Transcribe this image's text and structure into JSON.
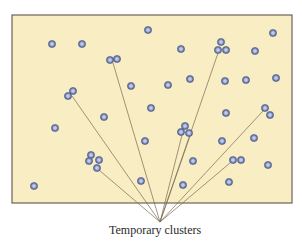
{
  "diagram": {
    "type": "particle-field",
    "box": {
      "x": 12,
      "y": 15,
      "width": 280,
      "height": 188,
      "fill": "#f8edc3",
      "stroke": "#6b6355"
    },
    "dot": {
      "radius": 3.6,
      "ring_color": "#6a79a8",
      "center_color": "#c3cbe8"
    },
    "leader_line_color": "#7a6a50",
    "label": {
      "text": "Temporary clusters",
      "x": 162,
      "y": 236,
      "anchor_x": 160,
      "anchor_y": 222
    },
    "singleton_dots": [
      [
        52,
        44
      ],
      [
        82,
        44
      ],
      [
        148,
        30
      ],
      [
        181,
        49
      ],
      [
        273,
        33
      ],
      [
        255,
        51
      ],
      [
        131,
        86
      ],
      [
        168,
        85
      ],
      [
        190,
        79
      ],
      [
        225,
        81
      ],
      [
        246,
        80
      ],
      [
        276,
        78
      ],
      [
        151,
        108
      ],
      [
        104,
        117
      ],
      [
        55,
        128
      ],
      [
        226,
        113
      ],
      [
        145,
        141
      ],
      [
        222,
        141
      ],
      [
        254,
        138
      ],
      [
        193,
        161
      ],
      [
        268,
        165
      ],
      [
        34,
        186
      ],
      [
        141,
        181
      ],
      [
        183,
        185
      ],
      [
        229,
        182
      ]
    ],
    "clusters": [
      {
        "name": "cluster-upper-left-pair",
        "dots": [
          [
            110,
            60
          ],
          [
            117,
            59
          ]
        ],
        "line_from": [
          113,
          63
        ]
      },
      {
        "name": "cluster-left-pair",
        "dots": [
          [
            73,
            91
          ],
          [
            68,
            96
          ]
        ],
        "line_from": [
          72,
          96
        ]
      },
      {
        "name": "cluster-bottom-left",
        "dots": [
          [
            91,
            155
          ],
          [
            89,
            161
          ],
          [
            99,
            160
          ],
          [
            97,
            168
          ]
        ],
        "line_from": [
          99,
          170
        ]
      },
      {
        "name": "cluster-center",
        "dots": [
          [
            185,
            126
          ],
          [
            181,
            132
          ],
          [
            189,
            133
          ]
        ],
        "line_from": [
          182,
          135
        ]
      },
      {
        "name": "cluster-center-b",
        "dots": [],
        "line_from": [
          190,
          136
        ]
      },
      {
        "name": "cluster-top-right",
        "dots": [
          [
            221,
            42
          ],
          [
            218,
            50
          ],
          [
            226,
            50
          ]
        ],
        "line_from": [
          218,
          53
        ]
      },
      {
        "name": "cluster-right-pair",
        "dots": [
          [
            265,
            108
          ],
          [
            270,
            115
          ]
        ],
        "line_from": [
          263,
          111
        ]
      },
      {
        "name": "cluster-lower-right-pair",
        "dots": [
          [
            233,
            160
          ],
          [
            241,
            160
          ]
        ],
        "line_from": [
          230,
          163
        ]
      }
    ]
  }
}
